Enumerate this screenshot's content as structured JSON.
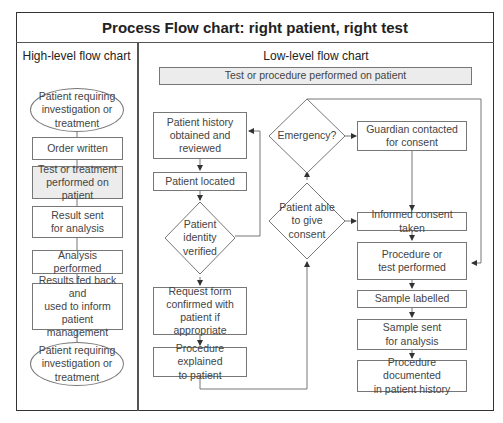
{
  "title": "Process Flow chart: right patient, right test",
  "high_level": {
    "heading": "High-level flow chart",
    "steps": [
      {
        "label": "Patient requiring\ninvestigation or\ntreatment",
        "shape": "oval"
      },
      {
        "label": "Order written",
        "shape": "box"
      },
      {
        "label": "Test or treatment\nperformed on patient",
        "shape": "box",
        "highlighted": true
      },
      {
        "label": "Result sent\nfor analysis",
        "shape": "box"
      },
      {
        "label": "Analysis performed",
        "shape": "box"
      },
      {
        "label": "Results fed back and\nused to inform\npatient management",
        "shape": "box"
      },
      {
        "label": "Patient requiring\ninvestigation or\ntreatment",
        "shape": "oval"
      }
    ]
  },
  "low_level": {
    "heading": "Low-level flow chart",
    "banner": "Test or procedure performed on patient",
    "left_column": [
      {
        "label": "Patient history\nobtained and\nreviewed"
      },
      {
        "label": "Patient located"
      },
      {
        "label": "Patient\nidentity\nverified",
        "shape": "diamond"
      },
      {
        "label": "Request form\nconfirmed with\npatient if appropriate"
      },
      {
        "label": "Procedure explained\nto patient"
      }
    ],
    "decisions": [
      {
        "label": "Emergency?"
      },
      {
        "label": "Patient able\nto give\nconsent"
      }
    ],
    "right_column": [
      {
        "label": "Guardian contacted\nfor consent"
      },
      {
        "label": "Informed consent taken"
      },
      {
        "label": "Procedure or\ntest performed"
      },
      {
        "label": "Sample labelled"
      },
      {
        "label": "Sample sent\nfor analysis"
      },
      {
        "label": "Procedure documented\nin patient history"
      }
    ]
  },
  "colors": {
    "border": "#777777",
    "shaded_fill": "#ececec",
    "frame": "#333333"
  }
}
